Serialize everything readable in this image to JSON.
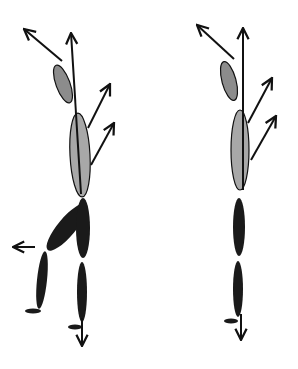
{
  "diagram": {
    "colors": {
      "background": "#ffffff",
      "upper_segment_fill": "#8c8c8c",
      "torso_fill": "#a8a8a8",
      "lower_segment_fill": "#1a1a1a",
      "outline": "#111111",
      "arrow": "#111111"
    },
    "figures": [
      {
        "id": "left-figure",
        "pose": "one leg raised, backward kick",
        "segments": [
          "head",
          "torso",
          "thigh-raised",
          "shank-raised",
          "foot-raised",
          "thigh-stance",
          "shank-stance",
          "foot-stance"
        ],
        "arrows": [
          "head-up-left",
          "vertical-up",
          "torso-up-right-1",
          "torso-up-right-2",
          "leg-left",
          "stance-down"
        ]
      },
      {
        "id": "right-figure",
        "pose": "upright standing",
        "segments": [
          "head",
          "torso",
          "thigh",
          "shank",
          "foot"
        ],
        "arrows": [
          "head-up-left",
          "vertical-up",
          "torso-up-right-1",
          "torso-up-right-2",
          "stance-down"
        ]
      }
    ]
  }
}
